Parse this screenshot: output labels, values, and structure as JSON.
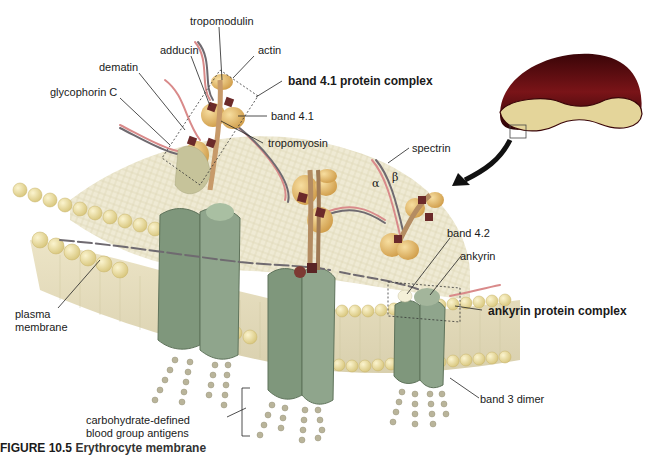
{
  "figure": {
    "caption_number": "FIGURE 10.5",
    "caption_text": "Erythrocyte membrane"
  },
  "labels": {
    "tropomodulin": "tropomodulin",
    "adducin": "adducin",
    "actin": "actin",
    "dematin": "dematin",
    "glycophorin_c": "glycophorin C",
    "band_41_complex": "band 4.1 protein complex",
    "band_41": "band 4.1",
    "tropomyosin": "tropomyosin",
    "spectrin": "spectrin",
    "alpha": "α",
    "beta": "β",
    "band_42": "band 4.2",
    "ankyrin": "ankyrin",
    "ankyrin_complex": "ankyrin protein complex",
    "plasma_membrane_1": "plasma",
    "plasma_membrane_2": "membrane",
    "band_3_dimer": "band 3 dimer",
    "carb_antigens_1": "carbohydrate-defined",
    "carb_antigens_2": "blood group antigens"
  },
  "colors": {
    "lipid_head": "#f2e6a8",
    "lipid_tail": "#e9e2c4",
    "band3": "#8fa58c",
    "band3_dark": "#74896f",
    "spectrin_alpha": "#d98a8a",
    "spectrin_beta": "#6f6a70",
    "band41_block": "#6b2a2a",
    "globule": "#e8c27a",
    "rbc_outer": "#5a0f12",
    "rbc_inner": "#e6d79a",
    "arrow": "#111111",
    "sugar": "#b9b49a"
  }
}
